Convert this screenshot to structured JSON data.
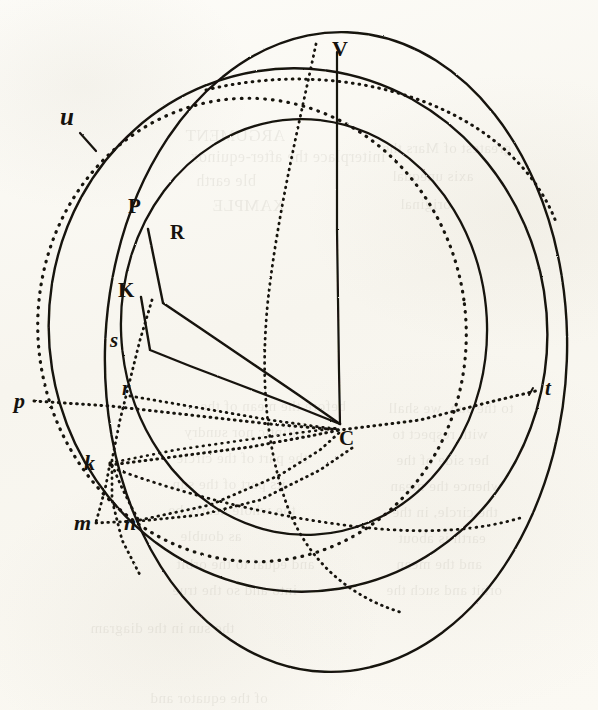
{
  "figure": {
    "kind": "geometric-astronomical-diagram",
    "medium": "engraved plate, aged paper",
    "width": 598,
    "height": 710,
    "paper_color": "#fbfaf6",
    "ink_color": "#16120d"
  },
  "labels": [
    {
      "id": "u",
      "text": "u",
      "style": "italic",
      "size": 25,
      "x": 60,
      "y": 104,
      "note": "on dotted great circle, upper left, with tick"
    },
    {
      "id": "V",
      "text": "V",
      "style": "roman",
      "size": 22,
      "x": 332,
      "y": 38,
      "note": "top of large solid circle"
    },
    {
      "id": "P",
      "text": "P",
      "style": "roman",
      "size": 21,
      "x": 128,
      "y": 196,
      "note": "upper pole on inclined circle"
    },
    {
      "id": "R",
      "text": "R",
      "style": "roman",
      "size": 20,
      "x": 170,
      "y": 222,
      "note": "intersection point"
    },
    {
      "id": "K",
      "text": "K",
      "style": "roman",
      "size": 21,
      "x": 118,
      "y": 280,
      "note": "node point"
    },
    {
      "id": "s",
      "text": "s",
      "style": "italic",
      "size": 21,
      "x": 110,
      "y": 330,
      "note": "lower-case s on arc"
    },
    {
      "id": "r",
      "text": "r",
      "style": "italic",
      "size": 21,
      "x": 122,
      "y": 378,
      "note": "lower-case r near dotted chord"
    },
    {
      "id": "p",
      "text": "p",
      "style": "italic",
      "size": 22,
      "x": 14,
      "y": 390,
      "note": "left end of dotted line p-t"
    },
    {
      "id": "t",
      "text": "t",
      "style": "italic",
      "size": 21,
      "x": 545,
      "y": 378,
      "note": "right end of dotted line p-t, with tick"
    },
    {
      "id": "C",
      "text": "C",
      "style": "roman",
      "size": 21,
      "x": 339,
      "y": 428,
      "note": "centre of the spheres"
    },
    {
      "id": "k",
      "text": "k",
      "style": "italic",
      "size": 22,
      "x": 84,
      "y": 452,
      "note": "lower node"
    },
    {
      "id": "m",
      "text": "m",
      "style": "italic",
      "size": 22,
      "x": 74,
      "y": 512,
      "note": "lower-left point"
    },
    {
      "id": "n",
      "text": "n",
      "style": "italic",
      "size": 22,
      "x": 124,
      "y": 512,
      "note": "point right of m"
    }
  ],
  "bleed_through_text": [
    {
      "text": "ARGUMENT",
      "x": 185,
      "y": 126,
      "size": 17
    },
    {
      "text": "initerplace the after-equinox",
      "x": 190,
      "y": 148,
      "size": 16
    },
    {
      "text": "ble earth",
      "x": 196,
      "y": 172,
      "size": 16
    },
    {
      "text": "XAMPLE",
      "x": 212,
      "y": 196,
      "size": 17
    },
    {
      "text": "greatest of Mars the",
      "x": 382,
      "y": 140,
      "size": 15
    },
    {
      "text": "axis unequal",
      "x": 392,
      "y": 168,
      "size": 15
    },
    {
      "text": "original",
      "x": 400,
      "y": 196,
      "size": 15
    },
    {
      "text": "before the mean of the",
      "x": 200,
      "y": 398,
      "size": 15
    },
    {
      "text": "elliptic nor sundry",
      "x": 184,
      "y": 424,
      "size": 15
    },
    {
      "text": "the part of the circle",
      "x": 176,
      "y": 450,
      "size": 15
    },
    {
      "text": "its part of the sun",
      "x": 172,
      "y": 476,
      "size": 15
    },
    {
      "text": "the whole nearly be",
      "x": 168,
      "y": 502,
      "size": 15
    },
    {
      "text": "as double",
      "x": 180,
      "y": 528,
      "size": 15
    },
    {
      "text": "and equal to the orbit",
      "x": 176,
      "y": 556,
      "size": 15
    },
    {
      "text": "into and so the true",
      "x": 172,
      "y": 582,
      "size": 15
    },
    {
      "text": "to the sun, we shall",
      "x": 388,
      "y": 400,
      "size": 15
    },
    {
      "text": "with respect to",
      "x": 392,
      "y": 426,
      "size": 15
    },
    {
      "text": "her side of the",
      "x": 396,
      "y": 452,
      "size": 15
    },
    {
      "text": "whence the mean",
      "x": 390,
      "y": 478,
      "size": 15
    },
    {
      "text": "the circle, in the",
      "x": 392,
      "y": 504,
      "size": 15
    },
    {
      "text": "earth is about",
      "x": 398,
      "y": 530,
      "size": 15
    },
    {
      "text": "and the mean",
      "x": 396,
      "y": 556,
      "size": 15
    },
    {
      "text": "orbit and such the",
      "x": 386,
      "y": 582,
      "size": 15
    },
    {
      "text": "the sun in the diagram",
      "x": 90,
      "y": 620,
      "size": 15
    },
    {
      "text": "of the equator and",
      "x": 150,
      "y": 690,
      "size": 15
    }
  ],
  "curves": {
    "big_solid_circle": {
      "role": "principal sphere / celestial globe outline",
      "cx": 335,
      "cy": 352,
      "rx": 232,
      "ry": 320,
      "dash": "none"
    },
    "second_solid_circle": {
      "role": "second great circle (oblique)",
      "cx": 300,
      "cy": 330,
      "rx": 248,
      "ry": 262,
      "dash": "none"
    },
    "inner_solid_circle": {
      "role": "inner circle through V and C region",
      "cx": 303,
      "cy": 327,
      "rx": 184,
      "ry": 208,
      "dash": "none"
    },
    "dotted_circle": {
      "role": "dotted great circle through u",
      "cx": 250,
      "cy": 330,
      "rx": 215,
      "ry": 232,
      "dash": "dotted"
    },
    "vertical_radius": {
      "role": "radius C–V",
      "from": "C",
      "to": "V"
    },
    "radius_CP": {
      "role": "radius C–P",
      "from": "C",
      "to": "P"
    },
    "radius_CK": {
      "role": "radius C–K",
      "from": "C",
      "to": "K"
    },
    "chord_pt": {
      "role": "dotted chord p–t through C",
      "from": "p",
      "to": "t",
      "dash": "dotted"
    },
    "dotted_kC": {
      "role": "dotted line k–C",
      "from": "k",
      "to": "C",
      "dash": "dotted"
    },
    "dotted_nC": {
      "role": "dotted line n–C",
      "from": "n",
      "to": "C",
      "dash": "dotted"
    },
    "dotted_km": {
      "role": "dotted line k–m",
      "from": "k",
      "to": "m",
      "dash": "dotted"
    },
    "dotted_kn": {
      "role": "dotted line k–n",
      "from": "k",
      "to": "n",
      "dash": "dotted"
    },
    "dotted_rk": {
      "role": "dotted arc r–k–s",
      "dash": "dotted"
    }
  }
}
